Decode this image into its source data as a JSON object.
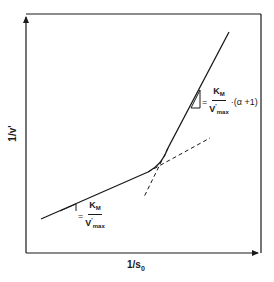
{
  "diagram": {
    "type": "Lineweaver-Burk style double-reciprocal plot with two linear regimes",
    "x_axis_label": {
      "main": "1/s",
      "sub": "0"
    },
    "y_axis_label": "1/v'",
    "colors": {
      "line": "#1a1a1a",
      "background": "#ffffff"
    },
    "slope_low": {
      "eq": "=",
      "numerator": "K",
      "numerator_sub": "M",
      "denominator": "V",
      "denominator_sup": "'",
      "denominator_sub": "max",
      "tail": ""
    },
    "slope_high": {
      "eq": "=",
      "numerator": "K",
      "numerator_sub": "M",
      "denominator": "V",
      "denominator_sup": "'",
      "denominator_sub": "max",
      "tail": "·(α +1)"
    },
    "geometry": {
      "frame": {
        "left": 26,
        "top": 14,
        "right": 261,
        "bottom": 253
      },
      "solid_curve": "M41,219 L148,172 Q162,165 168,148 L229,32",
      "dashed_low_extension": "M148,172 L210,138",
      "dashed_high_extension": "M168,148 L144,197",
      "slope_triangle_low": "M60,217 L84,206 L84,217 Z",
      "slope_triangle_high": "M191,100 L199,84 L199,100 Z"
    }
  }
}
